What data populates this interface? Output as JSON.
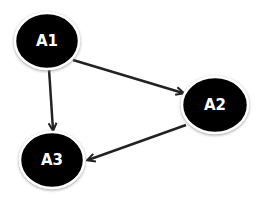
{
  "diagram": {
    "type": "directed-graph",
    "nodes": [
      {
        "id": "A1",
        "label": "A1",
        "cx": 47,
        "cy": 41
      },
      {
        "id": "A2",
        "label": "A2",
        "cx": 215,
        "cy": 105
      },
      {
        "id": "A3",
        "label": "A3",
        "cx": 52,
        "cy": 160
      }
    ],
    "edges": [
      {
        "from": "A1",
        "to": "A2"
      },
      {
        "from": "A1",
        "to": "A3"
      },
      {
        "from": "A2",
        "to": "A3"
      }
    ],
    "colors": {
      "node_fill": "#000000",
      "node_stroke": "#ffffff",
      "edge": "#222222",
      "label": "#ffffff"
    }
  }
}
